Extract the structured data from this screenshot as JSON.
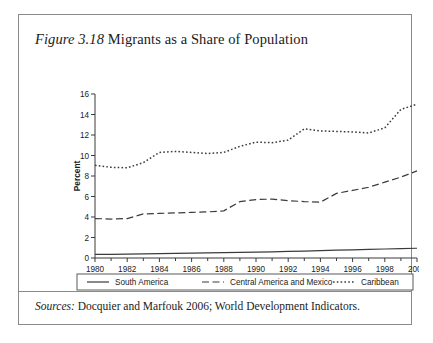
{
  "figure": {
    "label": "Figure 3.18",
    "title": "Migrants as a Share of Population",
    "source_label": "Sources:",
    "source_text": "Docquier and Marfouk 2006; World Development Indicators."
  },
  "chart_data": {
    "type": "line",
    "title": "Migrants as a Share of Population",
    "xlabel": "",
    "ylabel": "Percent",
    "xlim": [
      1980,
      2000
    ],
    "ylim": [
      0,
      16
    ],
    "yticks": [
      0,
      2,
      4,
      6,
      8,
      10,
      12,
      14,
      16
    ],
    "xticks": [
      1980,
      1982,
      1984,
      1986,
      1988,
      1990,
      1992,
      1994,
      1996,
      1998,
      2000
    ],
    "x_minor_ticks": [
      1981,
      1983,
      1985,
      1987,
      1989,
      1991,
      1993,
      1995,
      1997,
      1999
    ],
    "grid": false,
    "legend_position": "below-axes",
    "x": [
      1980,
      1981,
      1982,
      1983,
      1984,
      1985,
      1986,
      1987,
      1988,
      1989,
      1990,
      1991,
      1992,
      1993,
      1994,
      1995,
      1996,
      1997,
      1998,
      1999,
      2000
    ],
    "series": [
      {
        "name": "South America",
        "style": "solid",
        "color": "#3b3b3b",
        "values": [
          0.35,
          0.36,
          0.38,
          0.4,
          0.43,
          0.46,
          0.48,
          0.5,
          0.52,
          0.54,
          0.57,
          0.6,
          0.64,
          0.68,
          0.72,
          0.76,
          0.8,
          0.84,
          0.88,
          0.92,
          0.95
        ]
      },
      {
        "name": "Central America and Mexico",
        "style": "dashed",
        "color": "#3b3b3b",
        "values": [
          3.85,
          3.8,
          3.85,
          4.3,
          4.35,
          4.4,
          4.45,
          4.5,
          4.6,
          5.5,
          5.7,
          5.75,
          5.6,
          5.5,
          5.45,
          6.3,
          6.6,
          6.9,
          7.4,
          7.9,
          8.5
        ]
      },
      {
        "name": "Caribbean",
        "style": "dotted",
        "color": "#3b3b3b",
        "values": [
          9.05,
          8.85,
          8.8,
          9.3,
          10.3,
          10.4,
          10.3,
          10.2,
          10.3,
          10.9,
          11.3,
          11.25,
          11.5,
          12.6,
          12.4,
          12.35,
          12.3,
          12.2,
          12.7,
          14.5,
          15.0
        ]
      }
    ]
  },
  "legend": {
    "entries": [
      {
        "label": "South America",
        "style": "solid"
      },
      {
        "label": "Central America and Mexico",
        "style": "dashed"
      },
      {
        "label": "Caribbean",
        "style": "dotted"
      }
    ]
  }
}
